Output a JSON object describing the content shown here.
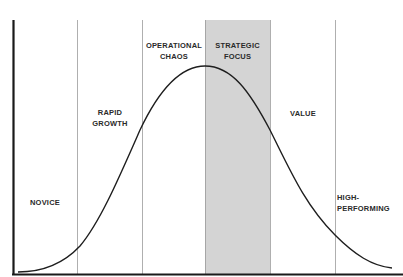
{
  "diagram": {
    "type": "bell-curve-stages",
    "colors": {
      "axis": "#1a1a1a",
      "divider": "#9a9a9a",
      "curve": "#1e1e1e",
      "highlight": "#d4d4d4",
      "text": "#2a2a2a"
    },
    "stages": [
      {
        "id": "novice",
        "label": "NOVICE"
      },
      {
        "id": "rapid-growth",
        "label": "RAPID\nGROWTH"
      },
      {
        "id": "operational-chaos",
        "label": "OPERATIONAL\nCHAOS"
      },
      {
        "id": "strategic-focus",
        "label": "STRATEGIC\nFOCUS",
        "highlighted": true
      },
      {
        "id": "value",
        "label": "VALUE"
      },
      {
        "id": "high-performing",
        "label": "HIGH-\nPERFORMING"
      }
    ]
  }
}
